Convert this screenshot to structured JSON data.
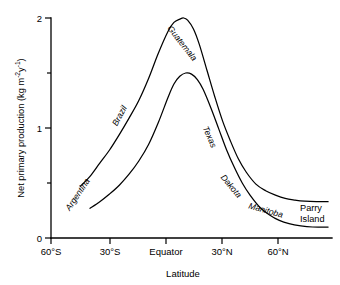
{
  "figure": {
    "name": "net-primary-production-vs-latitude"
  },
  "axes": {
    "y": {
      "title_main": "Net primary production (kg m",
      "title_sup1": "-2",
      "title_mid": "y",
      "title_sup2": "-1",
      "title_end": ")",
      "ticks": [
        {
          "value": 0,
          "label": "0",
          "major": true
        },
        {
          "value": 0.5,
          "label": "",
          "major": false
        },
        {
          "value": 1,
          "label": "1",
          "major": true
        },
        {
          "value": 1.5,
          "label": "",
          "major": false
        },
        {
          "value": 2,
          "label": "2",
          "major": true
        }
      ],
      "range": [
        0,
        2
      ]
    },
    "x": {
      "title": "Latitude",
      "ticks": [
        {
          "value": -60,
          "label": "60°S"
        },
        {
          "value": -30,
          "label": "30°S"
        },
        {
          "value": 0,
          "label": "Equator"
        },
        {
          "value": 30,
          "label": "30°N"
        },
        {
          "value": 60,
          "label": "60°N"
        }
      ],
      "range": [
        -60,
        84
      ]
    }
  },
  "curve_labels": [
    {
      "id": "argentina",
      "text": "Argentina"
    },
    {
      "id": "brazil",
      "text": "Brazil"
    },
    {
      "id": "guatemala",
      "text": "Guatemala"
    },
    {
      "id": "texas",
      "text": "Texas"
    },
    {
      "id": "dakota",
      "text": "Dakota"
    },
    {
      "id": "manitoba",
      "text": "Manitoba"
    },
    {
      "id": "parry-island-line1",
      "text": "Parry"
    },
    {
      "id": "parry-island-line2",
      "text": "Island"
    }
  ],
  "colors": {
    "ink": "#000000",
    "background": "#ffffff"
  },
  "chart_data": {
    "type": "line",
    "title": "",
    "xlabel": "Latitude",
    "ylabel": "Net primary production (kg m-2 y-1)",
    "xlim": [
      -60,
      84
    ],
    "ylim": [
      0,
      2
    ],
    "grid": false,
    "legend": null,
    "xtick_labels": [
      "60°S",
      "30°S",
      "Equator",
      "30°N",
      "60°N"
    ],
    "xtick_values": [
      -60,
      -30,
      0,
      30,
      60
    ],
    "ytick_labels": [
      "0",
      "1",
      "2"
    ],
    "ytick_values": [
      0,
      1,
      2
    ],
    "y_minor_ticks": [
      0.5,
      1.5
    ],
    "annotations": [
      "Argentina",
      "Brazil",
      "Guatemala",
      "Texas",
      "Dakota",
      "Manitoba",
      "Parry Island"
    ],
    "series": [
      {
        "name": "upper-envelope",
        "x": [
          -45,
          -40,
          -35,
          -30,
          -25,
          -20,
          -15,
          -10,
          -5,
          0,
          3,
          6,
          8,
          10,
          13,
          16,
          20,
          24,
          28,
          32,
          36,
          40,
          45,
          50,
          55,
          60,
          65,
          70,
          76,
          82
        ],
        "y": [
          0.47,
          0.56,
          0.68,
          0.8,
          0.94,
          1.09,
          1.25,
          1.45,
          1.68,
          1.88,
          1.96,
          1.99,
          2.0,
          1.98,
          1.9,
          1.76,
          1.52,
          1.28,
          1.06,
          0.88,
          0.72,
          0.6,
          0.49,
          0.43,
          0.39,
          0.36,
          0.345,
          0.335,
          0.33,
          0.33
        ]
      },
      {
        "name": "lower-envelope",
        "x": [
          -40,
          -35,
          -30,
          -25,
          -20,
          -15,
          -10,
          -5,
          0,
          3,
          6,
          9,
          12,
          15,
          18,
          22,
          26,
          30,
          34,
          38,
          42,
          47,
          52,
          57,
          62,
          68,
          74,
          82
        ],
        "y": [
          0.27,
          0.33,
          0.4,
          0.48,
          0.58,
          0.7,
          0.85,
          1.05,
          1.28,
          1.4,
          1.47,
          1.5,
          1.49,
          1.44,
          1.35,
          1.18,
          0.99,
          0.8,
          0.64,
          0.5,
          0.39,
          0.28,
          0.21,
          0.16,
          0.13,
          0.11,
          0.1,
          0.1
        ]
      }
    ]
  }
}
